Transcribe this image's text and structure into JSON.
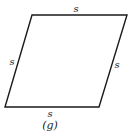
{
  "figure": {
    "shape": "rhombus",
    "labels": {
      "top": "s",
      "left": "s",
      "right": "s",
      "bottom": "s"
    },
    "caption": "(g)",
    "stroke_color": "#1a1a1a"
  }
}
